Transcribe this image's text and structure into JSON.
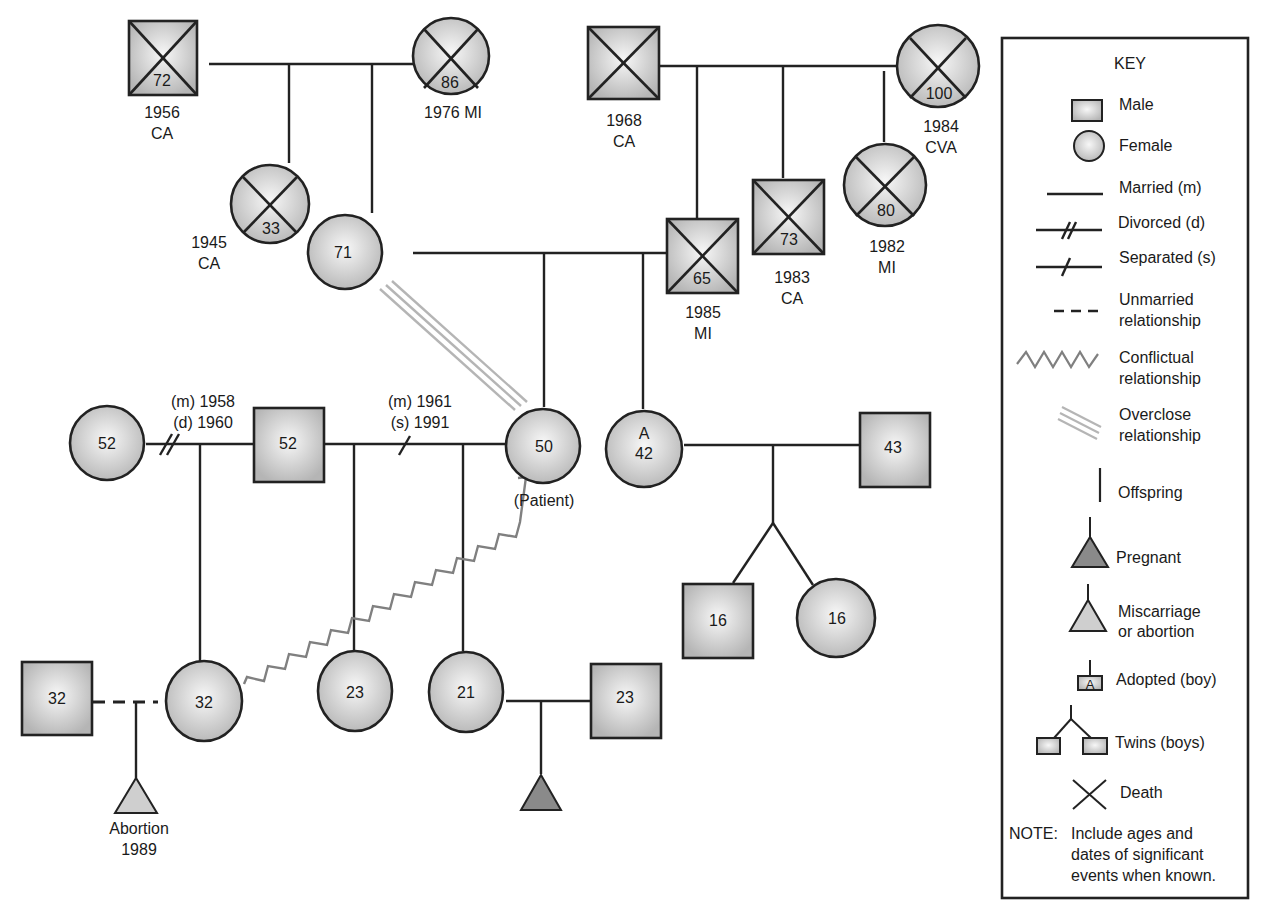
{
  "colors": {
    "line": "#222222",
    "fill_light": "#f2f2f2",
    "fill_dark": "#b8b8b8",
    "pregnant_fill": "#8a8a8a",
    "miscarriage_fill": "#cfcfcf",
    "conflict_line": "#808080",
    "overclose_line": "#b5b5b5"
  },
  "people": {
    "pgf": {
      "sex": "male",
      "age": "72",
      "deceased": true,
      "note_line1": "1956",
      "note_line2": "CA"
    },
    "pgm": {
      "sex": "female",
      "age": "86",
      "deceased": true,
      "note_line1": "1976 MI",
      "note_line2": ""
    },
    "aunt_mat": {
      "sex": "female",
      "age": "33",
      "deceased": true,
      "note_line1": "1945",
      "note_line2": "CA"
    },
    "mother": {
      "sex": "female",
      "age": "71",
      "deceased": false
    },
    "mgf": {
      "sex": "male",
      "age": "",
      "deceased": true,
      "note_line1": "1968",
      "note_line2": "CA"
    },
    "mgm": {
      "sex": "female",
      "age": "100",
      "deceased": true,
      "note_line1": "1984",
      "note_line2": "CVA"
    },
    "father": {
      "sex": "male",
      "age": "65",
      "deceased": true,
      "note_line1": "1985",
      "note_line2": "MI"
    },
    "uncle": {
      "sex": "male",
      "age": "73",
      "deceased": true,
      "note_line1": "1983",
      "note_line2": "CA"
    },
    "aunt": {
      "sex": "female",
      "age": "80",
      "deceased": true,
      "note_line1": "1982",
      "note_line2": "MI"
    },
    "ex_wife": {
      "sex": "female",
      "age": "52",
      "deceased": false
    },
    "husband": {
      "sex": "male",
      "age": "52",
      "deceased": false
    },
    "patient": {
      "sex": "female",
      "age": "50",
      "deceased": false,
      "note_line1": "(Patient)"
    },
    "sister": {
      "sex": "female",
      "age": "42",
      "adopted_mark": "A",
      "deceased": false
    },
    "sister_husband": {
      "sex": "male",
      "age": "43",
      "deceased": false
    },
    "twin_boy": {
      "sex": "male",
      "age": "16"
    },
    "twin_girl": {
      "sex": "female",
      "age": "16"
    },
    "partner": {
      "sex": "male",
      "age": "32"
    },
    "stepdaughter": {
      "sex": "female",
      "age": "32"
    },
    "daughter1": {
      "sex": "female",
      "age": "23"
    },
    "daughter2": {
      "sex": "female",
      "age": "21"
    },
    "son_in_law": {
      "sex": "male",
      "age": "23"
    }
  },
  "relationships": {
    "first_marriage": {
      "line1": "(m) 1958",
      "line2": "(d) 1960",
      "type": "divorced"
    },
    "second_marriage": {
      "line1": "(m) 1961",
      "line2": "(s) 1991",
      "type": "separated"
    },
    "abortion": {
      "line1": "Abortion",
      "line2": "1989"
    }
  },
  "key": {
    "title": "KEY",
    "items": [
      {
        "symbol": "male",
        "label": "Male"
      },
      {
        "symbol": "female",
        "label": "Female"
      },
      {
        "symbol": "married",
        "label": "Married (m)"
      },
      {
        "symbol": "divorced",
        "label": "Divorced (d)"
      },
      {
        "symbol": "separated",
        "label": "Separated (s)"
      },
      {
        "symbol": "unmarried",
        "label_line1": "Unmarried",
        "label_line2": "relationship"
      },
      {
        "symbol": "conflictual",
        "label_line1": "Conflictual",
        "label_line2": "relationship"
      },
      {
        "symbol": "overclose",
        "label_line1": "Overclose",
        "label_line2": "relationship"
      },
      {
        "symbol": "offspring",
        "label": "Offspring"
      },
      {
        "symbol": "pregnant",
        "label": "Pregnant"
      },
      {
        "symbol": "miscarriage",
        "label_line1": "Miscarriage",
        "label_line2": "or abortion"
      },
      {
        "symbol": "adopted",
        "mark": "A",
        "label": "Adopted (boy)"
      },
      {
        "symbol": "twins",
        "label": "Twins (boys)"
      },
      {
        "symbol": "death",
        "label": "Death"
      }
    ],
    "note_prefix": "NOTE:",
    "note_line1": "Include ages and",
    "note_line2": "dates of significant",
    "note_line3": "events when known."
  }
}
